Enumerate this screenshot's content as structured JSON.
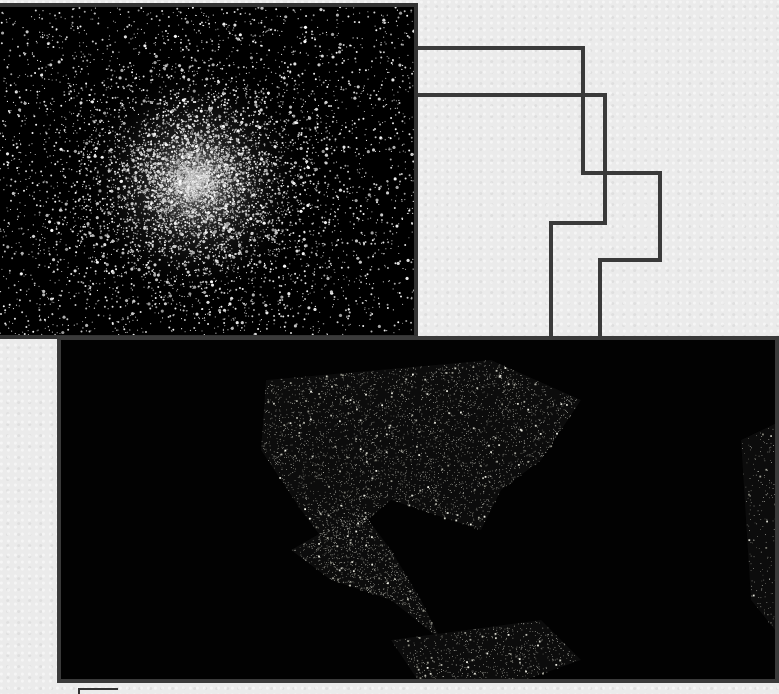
{
  "scene": {
    "background_color": "#ebebeb",
    "panel_border_color": "#3c3c3c",
    "connector_color": "#3a3a3a"
  },
  "cluster_image": {
    "subject": "globular-star-cluster",
    "center": [
      195,
      175
    ],
    "star_count": 9000,
    "core_radius": 120
  },
  "earth_image": {
    "subject": "earth-at-night-north-america",
    "regions": [
      {
        "name": "usa",
        "points": [
          [
            205,
            40
          ],
          [
            430,
            20
          ],
          [
            520,
            60
          ],
          [
            480,
            120
          ],
          [
            440,
            150
          ],
          [
            420,
            190
          ],
          [
            330,
            160
          ],
          [
            270,
            210
          ],
          [
            240,
            170
          ],
          [
            200,
            110
          ]
        ],
        "density": 4000
      },
      {
        "name": "mexico-central-america",
        "points": [
          [
            230,
            210
          ],
          [
            300,
            170
          ],
          [
            330,
            210
          ],
          [
            360,
            260
          ],
          [
            380,
            300
          ],
          [
            330,
            260
          ],
          [
            270,
            240
          ]
        ],
        "density": 900
      },
      {
        "name": "south-america-north",
        "points": [
          [
            330,
            300
          ],
          [
            480,
            280
          ],
          [
            520,
            320
          ],
          [
            450,
            345
          ],
          [
            360,
            345
          ]
        ],
        "density": 700
      },
      {
        "name": "europe-africa-edge",
        "points": [
          [
            680,
            100
          ],
          [
            722,
            80
          ],
          [
            722,
            300
          ],
          [
            690,
            260
          ]
        ],
        "density": 250
      }
    ]
  },
  "connectors": [
    {
      "name": "connector-1",
      "path": [
        [
          418,
          48
        ],
        [
          583,
          48
        ],
        [
          583,
          173
        ],
        [
          660,
          173
        ],
        [
          660,
          260
        ],
        [
          600,
          260
        ],
        [
          600,
          338
        ]
      ]
    },
    {
      "name": "connector-2",
      "path": [
        [
          418,
          95
        ],
        [
          605,
          95
        ],
        [
          605,
          223
        ],
        [
          551,
          223
        ],
        [
          551,
          338
        ]
      ]
    }
  ]
}
